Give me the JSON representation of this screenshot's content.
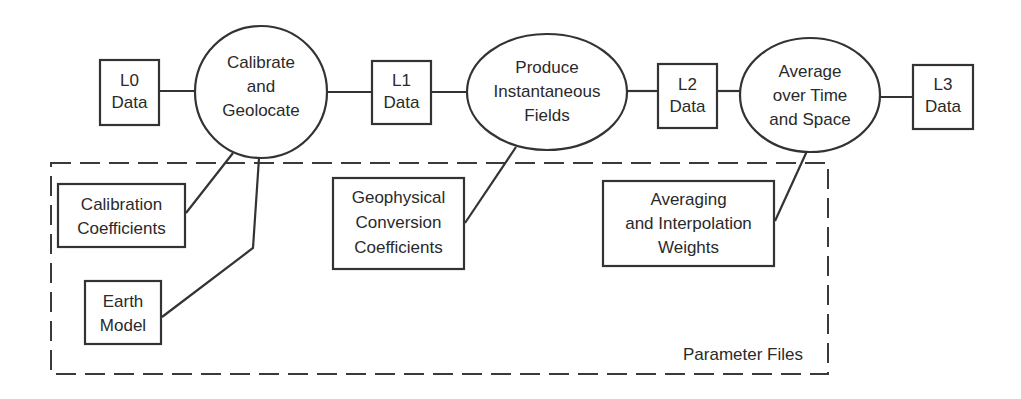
{
  "diagram": {
    "data_products": [
      {
        "id": "l0",
        "lines": [
          "L0",
          "Data"
        ]
      },
      {
        "id": "l1",
        "lines": [
          "L1",
          "Data"
        ]
      },
      {
        "id": "l2",
        "lines": [
          "L2",
          "Data"
        ]
      },
      {
        "id": "l3",
        "lines": [
          "L3",
          "Data"
        ]
      }
    ],
    "processes": [
      {
        "id": "calibrate",
        "lines": [
          "Calibrate",
          "and",
          "Geolocate"
        ]
      },
      {
        "id": "produce",
        "lines": [
          "Produce",
          "Instantaneous",
          "Fields"
        ]
      },
      {
        "id": "average",
        "lines": [
          "Average",
          "over Time",
          "and Space"
        ]
      }
    ],
    "parameters": [
      {
        "id": "calibration-coefficients",
        "lines": [
          "Calibration",
          "Coefficients"
        ],
        "feeds": "calibrate"
      },
      {
        "id": "earth-model",
        "lines": [
          "Earth",
          "Model"
        ],
        "feeds": "calibrate"
      },
      {
        "id": "geophysical-conversion-coefficients",
        "lines": [
          "Geophysical",
          "Conversion",
          "Coefficients"
        ],
        "feeds": "produce"
      },
      {
        "id": "averaging-interpolation-weights",
        "lines": [
          "Averaging",
          "and Interpolation",
          "Weights"
        ],
        "feeds": "average"
      }
    ],
    "parameter_group_label": "Parameter Files",
    "flow": [
      "l0",
      "calibrate",
      "l1",
      "produce",
      "l2",
      "average",
      "l3"
    ],
    "colors": {
      "line": "#333333",
      "text": "#2a2a2a",
      "background": "#ffffff"
    }
  }
}
